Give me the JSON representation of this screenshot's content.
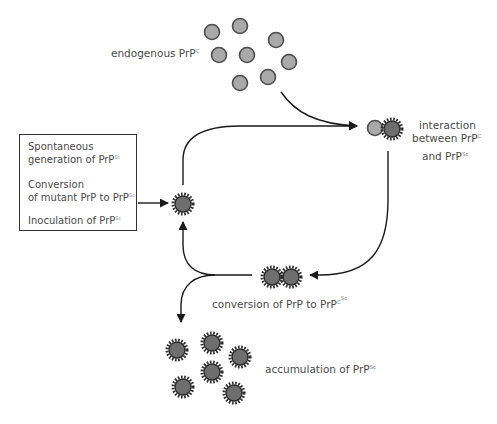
{
  "colors": {
    "native_fill": "#a9a9a9",
    "native_stroke": "#4d4d4d",
    "scrapie_fill": "#6e6e6e",
    "scrapie_spikes": "#2b2b2b",
    "arrow": "#1a1a1a",
    "text": "#4a4a4a"
  },
  "labels": {
    "endogenous": {
      "text": "endogenous PrP",
      "sup": "C"
    },
    "interaction_line1": "interaction",
    "interaction_line2": {
      "text": "between PrP",
      "sup": "C"
    },
    "interaction_line3": {
      "text": "and PrP",
      "sup": "Sc"
    },
    "conversion": {
      "text": "conversion of PrP to PrP",
      "sup_c": "C",
      "sup_sc": "Sc"
    },
    "accumulation": {
      "text": "accumulation of PrP",
      "sup": "Sc"
    }
  },
  "source_box": {
    "items": [
      {
        "line1": "Spontaneous",
        "line2": "generation of PrP",
        "sup": "Sc"
      },
      {
        "line1": "Conversion",
        "line2": "of mutant PrP to PrP",
        "sup": "Sc"
      },
      {
        "line1": "Inoculation of PrP",
        "sup": "Sc"
      }
    ]
  },
  "nodes": {
    "endogenous_prpc": {
      "type": "native",
      "count": 8
    },
    "interaction_pair": {
      "type": "native+scrapie",
      "count": 2
    },
    "seed_prpsc": {
      "type": "scrapie",
      "count": 1
    },
    "conversion_pair": {
      "type": "scrapie",
      "count": 2
    },
    "accumulated_prpsc": {
      "type": "scrapie",
      "count": 6
    }
  }
}
